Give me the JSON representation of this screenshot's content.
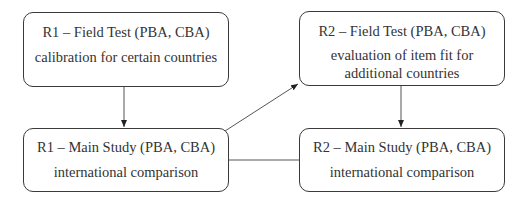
{
  "diagram": {
    "type": "flowchart",
    "nodes": [
      {
        "id": "r1_field",
        "title": "R1 – Field Test (PBA, CBA)",
        "description": "calibration for certain countries"
      },
      {
        "id": "r2_field",
        "title": "R2 – Field Test (PBA, CBA)",
        "description_line1": "evaluation of item fit for",
        "description_line2": "additional countries"
      },
      {
        "id": "r1_main",
        "title": "R1 – Main Study (PBA, CBA)",
        "description": "international comparison"
      },
      {
        "id": "r2_main",
        "title": "R2 – Main Study (PBA, CBA)",
        "description": "international comparison"
      }
    ],
    "edges": [
      {
        "from": "r1_field",
        "to": "r1_main",
        "style": "arrow"
      },
      {
        "from": "r1_main",
        "to": "r2_field",
        "style": "arrow"
      },
      {
        "from": "r2_field",
        "to": "r2_main",
        "style": "arrow"
      },
      {
        "from": "r1_main",
        "to": "r2_main",
        "style": "line"
      }
    ],
    "colors": {
      "stroke": "#3a3a3a",
      "text": "#333333",
      "background": "#ffffff"
    }
  }
}
